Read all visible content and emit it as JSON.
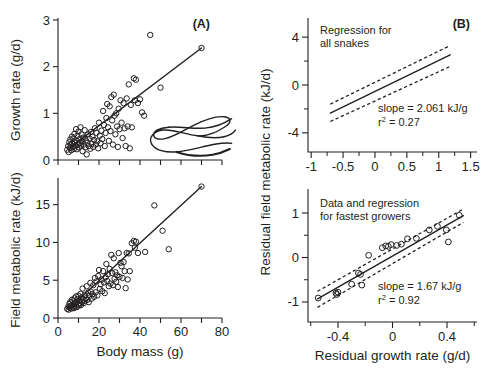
{
  "figure": {
    "title": "",
    "background": "#ffffff",
    "ink_color": "#231f20"
  },
  "panels": {
    "A_top": {
      "id": "(A)",
      "ylabel": "Growth rate (g/d)",
      "xlabel": "",
      "ytick_labels": [
        "0",
        "1",
        "2",
        "3"
      ],
      "xtick_labels": [],
      "annotation": "",
      "decoration": "snake-illustration"
    },
    "A_bottom": {
      "id": "",
      "ylabel": "Field metabolic rate (kJ/d)",
      "xlabel": "Body mass (g)",
      "ytick_labels": [
        "0",
        "5",
        "10",
        "15"
      ],
      "xtick_labels": [
        "0",
        "20",
        "40",
        "60",
        "80"
      ]
    },
    "B_top": {
      "id": "(B)",
      "ylabel": "Residual field metabolic rate (kJ/d)",
      "xlabel": "",
      "ytick_labels": [
        "4",
        "0",
        "-4"
      ],
      "xtick_labels": [
        "-1",
        "-0.5",
        "0",
        "0.5",
        "1",
        "1.5"
      ],
      "annotation_line1": "Regression for",
      "annotation_line2": "all snakes",
      "slope_text": "slope = 2.061 kJ/g",
      "r2_prefix": "r",
      "r2_sup": "2",
      "r2_value": " = 0.27"
    },
    "B_bottom": {
      "id": "",
      "ylabel": "",
      "xlabel": "Residual growth rate (g/d)",
      "ytick_labels": [
        "1",
        "0",
        "-1"
      ],
      "xtick_labels": [
        "-0.4",
        "0",
        "0.4"
      ],
      "annotation_line1": "Data and regression",
      "annotation_line2": "for fastest growers",
      "slope_text": "slope = 1.67 kJ/g",
      "r2_prefix": "r",
      "r2_sup": "2",
      "r2_value": " = 0.92"
    }
  },
  "chart_data": [
    {
      "panel": "A-top",
      "type": "scatter",
      "title": "(A)",
      "xlabel": "Body mass (g)",
      "ylabel": "Growth rate (g/d)",
      "xlim": [
        0,
        80
      ],
      "ylim": [
        0,
        3
      ],
      "xticks": [
        0,
        10,
        20,
        30,
        40,
        50,
        60,
        70,
        80
      ],
      "yticks": [
        0,
        1,
        2,
        3
      ],
      "grid": false,
      "legend": "none",
      "marker": "open-circle",
      "regression_line": {
        "x": [
          6,
          70
        ],
        "y": [
          0.27,
          2.4
        ]
      },
      "points": [
        [
          4.5,
          0.22
        ],
        [
          5.0,
          0.3
        ],
        [
          5.2,
          0.17
        ],
        [
          5.5,
          0.38
        ],
        [
          5.8,
          0.26
        ],
        [
          6.0,
          0.44
        ],
        [
          6.2,
          0.33
        ],
        [
          6.5,
          0.21
        ],
        [
          6.8,
          0.5
        ],
        [
          7.0,
          0.35
        ],
        [
          7.2,
          0.28
        ],
        [
          7.5,
          0.46
        ],
        [
          7.8,
          0.24
        ],
        [
          8.0,
          0.56
        ],
        [
          8.2,
          0.38
        ],
        [
          8.5,
          0.3
        ],
        [
          8.8,
          0.66
        ],
        [
          9.0,
          0.42
        ],
        [
          9.2,
          0.23
        ],
        [
          9.5,
          0.52
        ],
        [
          9.8,
          0.34
        ],
        [
          10.0,
          0.61
        ],
        [
          10.2,
          0.27
        ],
        [
          10.5,
          0.45
        ],
        [
          10.8,
          0.36
        ],
        [
          11.0,
          0.7
        ],
        [
          11.2,
          0.31
        ],
        [
          11.5,
          0.55
        ],
        [
          11.8,
          0.4
        ],
        [
          12.0,
          0.19
        ],
        [
          12.3,
          0.48
        ],
        [
          12.6,
          0.33
        ],
        [
          13.0,
          0.64
        ],
        [
          13.3,
          0.27
        ],
        [
          13.6,
          0.42
        ],
        [
          14.0,
          0.12
        ],
        [
          14.3,
          0.37
        ],
        [
          14.7,
          0.55
        ],
        [
          15.0,
          0.3
        ],
        [
          15.4,
          0.46
        ],
        [
          15.8,
          0.24
        ],
        [
          16.0,
          0.6
        ],
        [
          16.4,
          0.35
        ],
        [
          16.8,
          0.5
        ],
        [
          17.2,
          0.28
        ],
        [
          17.6,
          0.43
        ],
        [
          18.0,
          0.68
        ],
        [
          18.4,
          0.33
        ],
        [
          18.8,
          0.58
        ],
        [
          19.2,
          0.4
        ],
        [
          19.6,
          0.25
        ],
        [
          20.0,
          0.8
        ],
        [
          20.4,
          0.52
        ],
        [
          20.8,
          0.36
        ],
        [
          21.2,
          0.63
        ],
        [
          21.6,
          0.45
        ],
        [
          22.0,
          1.05
        ],
        [
          22.4,
          0.75
        ],
        [
          22.8,
          0.3
        ],
        [
          23.2,
          0.58
        ],
        [
          23.6,
          0.9
        ],
        [
          24.0,
          1.2
        ],
        [
          24.4,
          0.7
        ],
        [
          24.8,
          0.41
        ],
        [
          25.2,
          1.15
        ],
        [
          25.6,
          0.62
        ],
        [
          26.0,
          1.35
        ],
        [
          26.4,
          0.85
        ],
        [
          26.8,
          0.33
        ],
        [
          27.2,
          1.4
        ],
        [
          27.6,
          0.95
        ],
        [
          28.0,
          0.55
        ],
        [
          28.4,
          1.0
        ],
        [
          28.8,
          0.72
        ],
        [
          29.2,
          0.28
        ],
        [
          29.6,
          1.1
        ],
        [
          30.0,
          0.66
        ],
        [
          30.5,
          1.28
        ],
        [
          31.0,
          0.8
        ],
        [
          31.5,
          0.47
        ],
        [
          32.0,
          1.22
        ],
        [
          32.5,
          0.68
        ],
        [
          33.0,
          0.3
        ],
        [
          33.5,
          1.32
        ],
        [
          34.0,
          0.72
        ],
        [
          34.5,
          1.62
        ],
        [
          35.0,
          0.25
        ],
        [
          35.5,
          1.18
        ],
        [
          36.0,
          0.7
        ],
        [
          37.0,
          1.75
        ],
        [
          37.5,
          1.28
        ],
        [
          38.0,
          1.72
        ],
        [
          39.0,
          1.22
        ],
        [
          40.0,
          1.3
        ],
        [
          41.0,
          1.02
        ],
        [
          42.0,
          0.95
        ],
        [
          45.0,
          2.68
        ],
        [
          50.0,
          1.55
        ],
        [
          70.0,
          2.4
        ]
      ]
    },
    {
      "panel": "A-bottom",
      "type": "scatter",
      "title": "",
      "xlabel": "Body mass (g)",
      "ylabel": "Field metabolic rate (kJ/d)",
      "xlim": [
        0,
        80
      ],
      "ylim": [
        0,
        18
      ],
      "xticks": [
        0,
        10,
        20,
        30,
        40,
        50,
        60,
        70,
        80
      ],
      "yticks": [
        0,
        5,
        10,
        15
      ],
      "grid": false,
      "legend": "none",
      "marker": "open-circle",
      "regression_line": {
        "x": [
          5,
          70
        ],
        "y": [
          1.2,
          17.4
        ]
      },
      "points": [
        [
          4.5,
          1.2
        ],
        [
          5.0,
          1.5
        ],
        [
          5.2,
          1.1
        ],
        [
          5.5,
          1.85
        ],
        [
          5.8,
          1.35
        ],
        [
          6.0,
          2.1
        ],
        [
          6.2,
          1.6
        ],
        [
          6.5,
          1.25
        ],
        [
          6.8,
          2.4
        ],
        [
          7.0,
          1.75
        ],
        [
          7.2,
          1.4
        ],
        [
          7.5,
          2.2
        ],
        [
          7.8,
          1.3
        ],
        [
          8.0,
          2.6
        ],
        [
          8.2,
          1.95
        ],
        [
          8.5,
          1.55
        ],
        [
          8.8,
          2.85
        ],
        [
          9.0,
          2.05
        ],
        [
          9.2,
          1.45
        ],
        [
          9.5,
          2.5
        ],
        [
          9.8,
          1.8
        ],
        [
          10.0,
          2.95
        ],
        [
          10.2,
          1.65
        ],
        [
          10.5,
          2.3
        ],
        [
          10.8,
          1.9
        ],
        [
          11.0,
          3.2
        ],
        [
          11.2,
          1.7
        ],
        [
          11.5,
          2.7
        ],
        [
          11.8,
          2.15
        ],
        [
          12.0,
          3.9
        ],
        [
          12.3,
          2.45
        ],
        [
          12.6,
          1.98
        ],
        [
          13.0,
          3.05
        ],
        [
          13.3,
          2.25
        ],
        [
          13.6,
          2.6
        ],
        [
          14.0,
          4.2
        ],
        [
          14.3,
          2.4
        ],
        [
          14.7,
          3.35
        ],
        [
          15.0,
          2.1
        ],
        [
          15.4,
          2.95
        ],
        [
          15.8,
          4.65
        ],
        [
          16.0,
          3.5
        ],
        [
          16.4,
          2.55
        ],
        [
          16.8,
          3.15
        ],
        [
          17.2,
          4.35
        ],
        [
          17.6,
          2.8
        ],
        [
          18.0,
          5.3
        ],
        [
          18.4,
          3.4
        ],
        [
          18.8,
          4.85
        ],
        [
          19.2,
          3.0
        ],
        [
          19.6,
          5.55
        ],
        [
          20.0,
          6.35
        ],
        [
          20.4,
          3.85
        ],
        [
          20.8,
          4.45
        ],
        [
          21.2,
          5.1
        ],
        [
          21.6,
          3.55
        ],
        [
          22.0,
          6.2
        ],
        [
          22.4,
          4.7
        ],
        [
          22.8,
          3.3
        ],
        [
          23.2,
          5.4
        ],
        [
          23.6,
          7.15
        ],
        [
          24.0,
          4.9
        ],
        [
          24.4,
          5.8
        ],
        [
          24.8,
          4.2
        ],
        [
          25.2,
          6.5
        ],
        [
          25.6,
          4.55
        ],
        [
          26.0,
          8.35
        ],
        [
          26.4,
          5.95
        ],
        [
          26.8,
          4.35
        ],
        [
          27.2,
          7.9
        ],
        [
          27.6,
          5.2
        ],
        [
          28.0,
          6.05
        ],
        [
          28.4,
          4.8
        ],
        [
          28.8,
          5.65
        ],
        [
          29.2,
          4.1
        ],
        [
          29.6,
          8.6
        ],
        [
          30.0,
          5.45
        ],
        [
          30.5,
          7.3
        ],
        [
          31.0,
          6.85
        ],
        [
          31.5,
          5.3
        ],
        [
          32.0,
          7.4
        ],
        [
          32.5,
          6.2
        ],
        [
          33.0,
          3.95
        ],
        [
          33.5,
          8.6
        ],
        [
          34.0,
          5.1
        ],
        [
          34.5,
          8.55
        ],
        [
          35.0,
          6.2
        ],
        [
          36.0,
          9.9
        ],
        [
          37.0,
          10.2
        ],
        [
          37.5,
          9.3
        ],
        [
          38.0,
          10.1
        ],
        [
          39.0,
          8.6
        ],
        [
          42.5,
          8.75
        ],
        [
          47.0,
          14.9
        ],
        [
          51.0,
          11.55
        ],
        [
          54.0,
          9.1
        ],
        [
          70.0,
          17.4
        ]
      ]
    },
    {
      "panel": "B-top",
      "type": "line",
      "title": "(B)",
      "subtitle": "Regression for all snakes",
      "xlabel": "Residual growth rate (g/d)",
      "ylabel": "Residual field metabolic rate (kJ/d)",
      "xlim": [
        -1.05,
        1.6
      ],
      "ylim": [
        -5.6,
        5.6
      ],
      "xticks": [
        -1,
        -0.5,
        0,
        0.5,
        1,
        1.5
      ],
      "yticks": [
        -4,
        0,
        4
      ],
      "grid": false,
      "legend": "none",
      "slope": 2.061,
      "slope_units": "kJ/g",
      "r_squared": 0.27,
      "fit": {
        "x": [
          -0.7,
          1.18
        ],
        "y": [
          -2.35,
          2.52
        ]
      },
      "ci_upper": {
        "x": [
          -0.7,
          1.18
        ],
        "y": [
          -1.6,
          3.3
        ]
      },
      "ci_lower": {
        "x": [
          -0.7,
          1.18
        ],
        "y": [
          -3.05,
          1.55
        ]
      },
      "points": []
    },
    {
      "panel": "B-bottom",
      "type": "scatter",
      "title": "",
      "subtitle": "Data and regression for fastest growers",
      "xlabel": "Residual growth rate (g/d)",
      "ylabel": "Residual field metabolic rate (kJ/d)",
      "xlim": [
        -0.62,
        0.62
      ],
      "ylim": [
        -1.45,
        1.45
      ],
      "xticks": [
        -0.4,
        0,
        0.4
      ],
      "yticks": [
        -1,
        0,
        1
      ],
      "grid": false,
      "legend": "none",
      "marker": "open-circle",
      "slope": 1.67,
      "slope_units": "kJ/g",
      "r_squared": 0.92,
      "fit": {
        "x": [
          -0.55,
          0.52
        ],
        "y": [
          -0.93,
          0.94
        ]
      },
      "ci_upper": {
        "x": [
          -0.55,
          0.52
        ],
        "y": [
          -0.76,
          1.09
        ]
      },
      "ci_lower": {
        "x": [
          -0.55,
          0.52
        ],
        "y": [
          -1.12,
          0.79
        ]
      },
      "points": [
        [
          -0.545,
          -0.91
        ],
        [
          -0.415,
          -0.8
        ],
        [
          -0.408,
          -0.83
        ],
        [
          -0.4,
          -0.78
        ],
        [
          -0.3,
          -0.6
        ],
        [
          -0.25,
          -0.35
        ],
        [
          -0.235,
          -0.38
        ],
        [
          -0.225,
          -0.62
        ],
        [
          -0.175,
          0.05
        ],
        [
          -0.075,
          0.22
        ],
        [
          -0.05,
          0.26
        ],
        [
          -0.03,
          0.25
        ],
        [
          -0.01,
          0.29
        ],
        [
          0.03,
          0.27
        ],
        [
          0.065,
          0.3
        ],
        [
          0.11,
          0.42
        ],
        [
          0.175,
          0.43
        ],
        [
          0.27,
          0.62
        ],
        [
          0.33,
          0.7
        ],
        [
          0.395,
          0.62
        ],
        [
          0.41,
          0.35
        ],
        [
          0.49,
          0.95
        ]
      ]
    }
  ]
}
